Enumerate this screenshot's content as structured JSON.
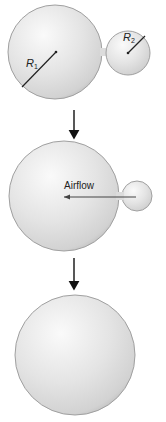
{
  "title": "",
  "stages": [
    {
      "id": "stage-1",
      "description": "Two connected bubbles of different radii",
      "bubbles": [
        {
          "name": "large-bubble",
          "label_main": "R",
          "label_sub": "1"
        },
        {
          "name": "small-bubble",
          "label_main": "R",
          "label_sub": "2"
        }
      ]
    },
    {
      "id": "stage-2",
      "description": "Air flows from small bubble into large bubble",
      "airflow_label": "Airflow"
    },
    {
      "id": "stage-3",
      "description": "Single merged large bubble"
    }
  ],
  "colors": {
    "bubble_fill": "#e6e6e6",
    "bubble_edge": "#9a9a9a",
    "line": "#222222",
    "arrow": "#111111"
  }
}
